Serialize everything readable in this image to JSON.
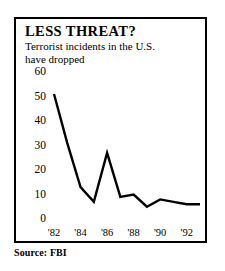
{
  "headline": "LESS THREAT?",
  "subhead_lines": [
    "Terrorist incidents in the U.S.",
    "have dropped"
  ],
  "source": "Source: FBI",
  "colors": {
    "line": "#000000",
    "frame": "#000000",
    "background": "#ffffff",
    "text": "#000000"
  },
  "chart_data": {
    "type": "line",
    "title": "LESS THREAT?",
    "subtitle": "Terrorist incidents in the U.S. have dropped",
    "xlabel": "",
    "ylabel": "",
    "source": "Source: FBI",
    "grid": false,
    "legend": false,
    "ylim": [
      0,
      60
    ],
    "xlim": [
      1982,
      1993
    ],
    "ytick_labels": [
      "60",
      "50",
      "40",
      "30",
      "20",
      "10",
      "0"
    ],
    "ytick_values": [
      60,
      50,
      40,
      30,
      20,
      10,
      0
    ],
    "xtick_labels": [
      "'82",
      "'84",
      "'86",
      "'88",
      "'90",
      "'92"
    ],
    "xtick_values": [
      1982,
      1984,
      1986,
      1988,
      1990,
      1992
    ],
    "x": [
      1982,
      1983,
      1984,
      1985,
      1986,
      1987,
      1988,
      1989,
      1990,
      1991,
      1992,
      1993
    ],
    "values": [
      51,
      31,
      13,
      7,
      27,
      9,
      10,
      5,
      8,
      7,
      6,
      6
    ],
    "series": [
      {
        "name": "Terrorist incidents in the U.S.",
        "values": [
          51,
          31,
          13,
          7,
          27,
          9,
          10,
          5,
          8,
          7,
          6,
          6
        ]
      }
    ]
  }
}
